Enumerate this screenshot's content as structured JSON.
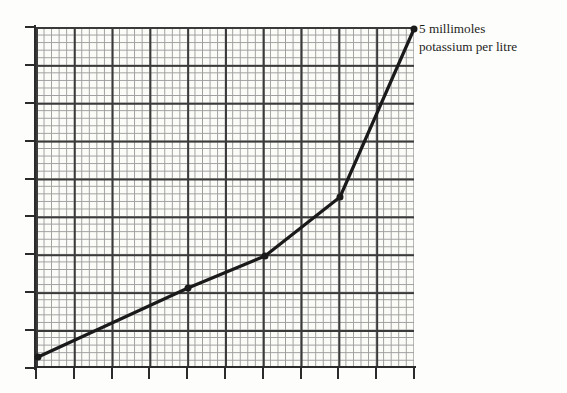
{
  "figure": {
    "background_color": "#fdfdfb",
    "plot_background_color": "#fbfbf8",
    "annotation": {
      "line1": "5 millimoles",
      "line2": "potassium per litre",
      "full_text": "5 millimoles potassium per litre",
      "color": "#1d1d1d"
    }
  },
  "axes": {
    "minor_grid_color": "#8e8e8e",
    "major_grid_color": "#3a3a3a",
    "axis_color": "#2b2b2b",
    "minor_cells_x": 50,
    "minor_cells_y": 45,
    "major_every": 5,
    "x_tick_positions": [
      0,
      37.8,
      75.6,
      113.4,
      151.2,
      189.0,
      226.8,
      264.6,
      302.4,
      340.2,
      378.0
    ],
    "y_tick_positions": [
      0,
      37.89,
      75.78,
      113.67,
      151.56,
      189.45,
      227.34,
      265.23,
      303.12,
      341.0
    ]
  },
  "chart_data": {
    "type": "line",
    "title": "",
    "xlabel": "",
    "ylabel": "",
    "xlim": [
      0,
      50
    ],
    "ylim": [
      0,
      45
    ],
    "grid": true,
    "legend": false,
    "annotations": [
      {
        "text": "5 millimoles potassium per litre",
        "attached_to_point_index": 4,
        "position": "right-of-endpoint"
      }
    ],
    "series": [
      {
        "name": "potassium concentration",
        "line_color": "#1a1a1a",
        "line_width": 3.2,
        "marker": "dot",
        "marker_size": 7,
        "x": [
          0.26,
          20.1,
          30.3,
          40.2,
          50.0
        ],
        "y": [
          1.45,
          10.6,
          14.8,
          22.6,
          44.7
        ],
        "pixel_points": [
          {
            "x": 38,
            "y": 357
          },
          {
            "x": 188,
            "y": 288
          },
          {
            "x": 265,
            "y": 256
          },
          {
            "x": 340,
            "y": 197
          },
          {
            "x": 414,
            "y": 29
          }
        ]
      }
    ]
  }
}
